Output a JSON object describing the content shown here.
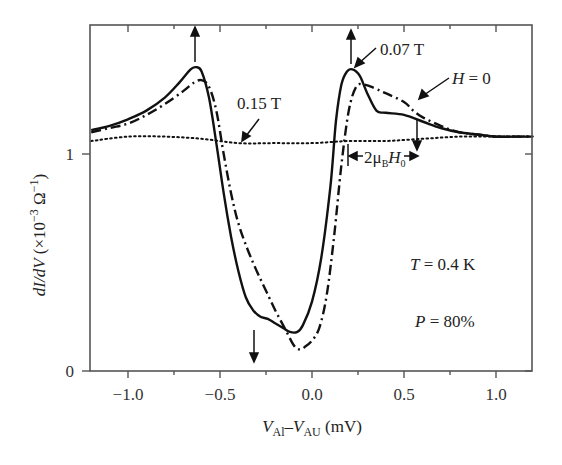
{
  "chart_data": {
    "type": "line",
    "title": "",
    "xlabel": "V_Al − V_AU (mV)",
    "xlabel_parts": {
      "v1": "V",
      "s1": "Al",
      "minus": "–",
      "v2": "V",
      "s2": "AU",
      "unit": " (mV)"
    },
    "ylabel": "dI/dV (×10⁻³ Ω⁻¹)",
    "ylabel_parts": {
      "main": "dI/dV",
      "rest": " (×10",
      "exp": "−3",
      "unit": " Ω",
      "exp2": "−1",
      "close": ")"
    },
    "xlim": [
      -1.2,
      1.2
    ],
    "ylim": [
      0,
      1.59
    ],
    "xticks": [
      -1.0,
      -0.5,
      0.0,
      0.5,
      1.0
    ],
    "xtick_labels": [
      "−1.0",
      "−0.5",
      "0.0",
      "0.5",
      "1.0"
    ],
    "xminor": [
      -0.75,
      -0.25,
      0.25,
      0.75
    ],
    "yticks": [
      0,
      1
    ],
    "ytick_labels": [
      "0",
      "1"
    ],
    "grid": false,
    "legend": "none (inline annotations)",
    "series": [
      {
        "name": "0.07 T",
        "style": "solid",
        "x": [
          -1.2,
          -1.1,
          -1.0,
          -0.9,
          -0.8,
          -0.72,
          -0.66,
          -0.63,
          -0.6,
          -0.56,
          -0.52,
          -0.48,
          -0.44,
          -0.4,
          -0.36,
          -0.32,
          -0.28,
          -0.24,
          -0.2,
          -0.16,
          -0.12,
          -0.08,
          -0.05,
          0.0,
          0.05,
          0.1,
          0.13,
          0.16,
          0.19,
          0.22,
          0.26,
          0.3,
          0.35,
          0.4,
          0.5,
          0.6,
          0.7,
          0.8,
          0.9,
          1.0,
          1.1,
          1.2
        ],
        "y": [
          1.11,
          1.13,
          1.16,
          1.2,
          1.26,
          1.33,
          1.39,
          1.4,
          1.38,
          1.26,
          1.05,
          0.82,
          0.62,
          0.46,
          0.34,
          0.28,
          0.25,
          0.24,
          0.22,
          0.2,
          0.18,
          0.18,
          0.21,
          0.32,
          0.52,
          0.85,
          1.15,
          1.32,
          1.38,
          1.39,
          1.36,
          1.28,
          1.2,
          1.19,
          1.18,
          1.15,
          1.12,
          1.1,
          1.09,
          1.08,
          1.08,
          1.08
        ]
      },
      {
        "name": "H = 0",
        "style": "dash-dot",
        "x": [
          -1.2,
          -1.1,
          -1.0,
          -0.9,
          -0.8,
          -0.7,
          -0.64,
          -0.6,
          -0.56,
          -0.52,
          -0.48,
          -0.44,
          -0.4,
          -0.35,
          -0.3,
          -0.25,
          -0.2,
          -0.15,
          -0.1,
          -0.07,
          -0.04,
          0.0,
          0.04,
          0.08,
          0.12,
          0.16,
          0.2,
          0.24,
          0.28,
          0.32,
          0.4,
          0.5,
          0.55,
          0.6,
          0.7,
          0.8,
          0.9,
          1.0,
          1.1,
          1.2
        ],
        "y": [
          1.1,
          1.12,
          1.14,
          1.18,
          1.23,
          1.29,
          1.33,
          1.34,
          1.31,
          1.2,
          1.0,
          0.82,
          0.68,
          0.56,
          0.46,
          0.37,
          0.28,
          0.2,
          0.12,
          0.1,
          0.11,
          0.14,
          0.2,
          0.35,
          0.62,
          0.95,
          1.2,
          1.31,
          1.32,
          1.31,
          1.28,
          1.24,
          1.2,
          1.17,
          1.13,
          1.1,
          1.09,
          1.08,
          1.08,
          1.08
        ]
      },
      {
        "name": "0.15 T",
        "style": "dotted",
        "x": [
          -1.2,
          -1.0,
          -0.8,
          -0.6,
          -0.4,
          -0.2,
          0.0,
          0.2,
          0.4,
          0.6,
          0.8,
          1.0,
          1.2
        ],
        "y": [
          1.06,
          1.08,
          1.08,
          1.07,
          1.05,
          1.05,
          1.05,
          1.06,
          1.06,
          1.07,
          1.08,
          1.08,
          1.08
        ]
      }
    ],
    "annotations": [
      {
        "text": "0.07 T",
        "x": 0.37,
        "y": 1.48
      },
      {
        "text": "H = 0",
        "x": 0.77,
        "y": 1.36
      },
      {
        "text": "0.15 T",
        "x": -0.4,
        "y": 1.23
      },
      {
        "text": "T = 0.4 K",
        "x": 0.53,
        "y": 0.52
      },
      {
        "text": "P = 80%",
        "x": 0.56,
        "y": 0.22
      },
      {
        "text": "2μB H0",
        "x": 0.32,
        "y": 0.99
      }
    ],
    "arrows": [
      {
        "x": -0.64,
        "direction": "up"
      },
      {
        "x": 0.2,
        "direction": "up"
      },
      {
        "x": -0.32,
        "direction": "down"
      },
      {
        "x": 0.57,
        "direction": "down"
      }
    ]
  },
  "labels": {
    "t007": "0.07 T",
    "h0_var": "H",
    "h0_rest": " = 0",
    "t015": "0.15 T",
    "temp_var": "T",
    "temp_rest": " = 0.4 K",
    "pol_var": "P",
    "pol_rest": " = 80%",
    "zeeman_pre": "2μ",
    "zeeman_sub": "B",
    "zeeman_var": "H",
    "zeeman_sub2": "0"
  }
}
